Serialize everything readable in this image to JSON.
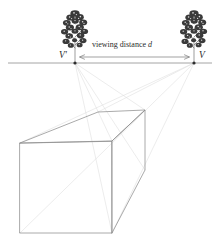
{
  "figure": {
    "type": "two-point-perspective-diagram",
    "background_color": "#ffffff",
    "line_color": "#8d8d8d",
    "construction_line_color": "#d5d5d5",
    "tree_color": "#3a3a3a",
    "text_color": "#2b2b2b"
  },
  "labels": {
    "vanishing_point_left": "V'",
    "vanishing_point_right": "V",
    "viewing_distance_text": "viewing distance ",
    "viewing_distance_symbol": "d"
  },
  "geometry": {
    "horizon_line": {
      "y": 63,
      "x_start": 8,
      "x_end": 212
    },
    "vanishing_point_left": {
      "x": 75,
      "y": 63
    },
    "vanishing_point_right": {
      "x": 194,
      "y": 63
    },
    "distance_arrow": {
      "y": 57,
      "x_start": 80,
      "x_end": 189
    },
    "box": {
      "front_top_left": {
        "x": 20,
        "y": 143
      },
      "front_top_right": {
        "x": 112,
        "y": 141
      },
      "front_bottom_left": {
        "x": 20,
        "y": 233
      },
      "front_bottom_right": {
        "x": 112,
        "y": 233
      },
      "back_top_left": {
        "x": 98,
        "y": 112
      },
      "back_top_right": {
        "x": 145,
        "y": 110
      },
      "back_bottom_right": {
        "x": 145,
        "y": 170
      }
    },
    "tree_left": {
      "x": 75,
      "y_base": 63,
      "height": 52
    },
    "tree_right": {
      "x": 194,
      "y_base": 63,
      "height": 52
    }
  }
}
